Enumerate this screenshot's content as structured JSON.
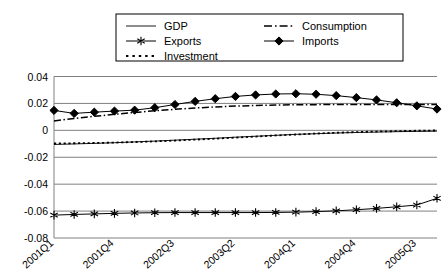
{
  "chart_data": {
    "type": "line",
    "title": "",
    "xlabel": "",
    "ylabel": "",
    "ylim": [
      -0.08,
      0.04
    ],
    "ytick_values": [
      0.04,
      0.02,
      0,
      -0.02,
      -0.04,
      -0.06,
      -0.08
    ],
    "ytick_labels": [
      "0.04",
      "0.02",
      "0",
      "-0.02",
      "-0.04",
      "-0.06",
      "-0.08"
    ],
    "grid": true,
    "legend_position": "top",
    "x": [
      "2001Q1",
      "2001Q2",
      "2001Q3",
      "2001Q4",
      "2002Q1",
      "2002Q2",
      "2002Q3",
      "2002Q4",
      "2003Q1",
      "2003Q2",
      "2003Q3",
      "2003Q4",
      "2004Q1",
      "2004Q2",
      "2004Q3",
      "2004Q4",
      "2005Q1",
      "2005Q2",
      "2005Q3",
      "2005Q4"
    ],
    "xtick_labels": [
      "2001Q1",
      "2001Q4",
      "2002Q3",
      "2003Q2",
      "2004Q1",
      "2004Q4",
      "2005Q3"
    ],
    "xtick_indices": [
      0,
      3,
      6,
      9,
      12,
      15,
      18
    ],
    "series": [
      {
        "name": "GDP",
        "style": "solid-thin",
        "marker": "none",
        "values": [
          -0.0105,
          -0.0101,
          -0.0097,
          -0.0092,
          -0.0086,
          -0.008,
          -0.0073,
          -0.0066,
          -0.0059,
          -0.0051,
          -0.0044,
          -0.0037,
          -0.003,
          -0.0025,
          -0.002,
          -0.0016,
          -0.0013,
          -0.001,
          -0.0008,
          -0.0006
        ]
      },
      {
        "name": "Consumption",
        "style": "dash-dot",
        "marker": "none",
        "values": [
          0.007,
          0.0088,
          0.0104,
          0.0119,
          0.0133,
          0.0145,
          0.0156,
          0.0166,
          0.0174,
          0.018,
          0.0185,
          0.0188,
          0.019,
          0.0191,
          0.0192,
          0.0192,
          0.0192,
          0.0192,
          0.0192,
          0.0192
        ]
      },
      {
        "name": "Investment",
        "style": "dotted",
        "marker": "none",
        "values": [
          -0.0098,
          -0.0096,
          -0.0094,
          -0.0091,
          -0.0087,
          -0.0082,
          -0.0076,
          -0.0069,
          -0.0062,
          -0.0054,
          -0.0046,
          -0.0038,
          -0.0031,
          -0.0024,
          -0.0018,
          -0.0013,
          -0.0009,
          -0.0006,
          -0.0003,
          -0.0001
        ]
      },
      {
        "name": "Exports",
        "style": "solid",
        "marker": "star",
        "values": [
          -0.063,
          -0.0625,
          -0.0621,
          -0.0617,
          -0.0614,
          -0.0612,
          -0.0611,
          -0.0611,
          -0.0611,
          -0.0611,
          -0.0611,
          -0.061,
          -0.0608,
          -0.0604,
          -0.0598,
          -0.059,
          -0.058,
          -0.0568,
          -0.0555,
          -0.0505
        ]
      },
      {
        "name": "Imports",
        "style": "solid",
        "marker": "diamond",
        "values": [
          0.0148,
          0.0126,
          0.0135,
          0.0143,
          0.015,
          0.0168,
          0.0192,
          0.0215,
          0.0235,
          0.0252,
          0.0263,
          0.027,
          0.0272,
          0.0268,
          0.0258,
          0.0243,
          0.0226,
          0.0205,
          0.0182,
          0.0158
        ]
      }
    ]
  },
  "legend": {
    "entries": [
      {
        "label": "GDP",
        "style": "solid-thin",
        "marker": "none"
      },
      {
        "label": "Consumption",
        "style": "dash-dot",
        "marker": "none"
      },
      {
        "label": "Exports",
        "style": "solid",
        "marker": "star"
      },
      {
        "label": "Imports",
        "style": "solid",
        "marker": "diamond"
      },
      {
        "label": "Investment",
        "style": "dotted",
        "marker": "none"
      }
    ]
  },
  "colors": {
    "line": "#000000",
    "grid": "#808080",
    "background": "#ffffff",
    "legend_border": "#000000"
  }
}
